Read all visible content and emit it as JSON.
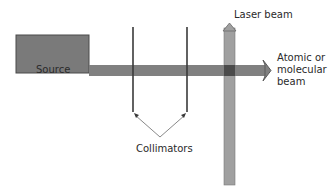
{
  "diagram": {
    "source": {
      "label": "Source",
      "fill": "#7a7a7a",
      "stroke": "#4a4a4a"
    },
    "laser_beam": {
      "label": "Laser beam",
      "fill": "#9a9a9a",
      "stroke": "#6a6a6a"
    },
    "atomic_beam": {
      "label": "Atomic or molecular beam",
      "fill": "#808080",
      "stroke": "#5a5a5a"
    },
    "intersection": {
      "fill": "#4a4a4a"
    },
    "collimators": {
      "label": "Collimators",
      "stroke": "#3a3a3a",
      "pointer_stroke": "#7a7a7a"
    }
  }
}
